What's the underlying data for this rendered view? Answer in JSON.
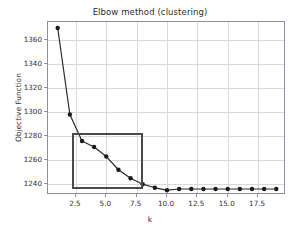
{
  "chart_data": {
    "type": "line",
    "title": "Elbow method (clustering)",
    "xlabel": "k",
    "ylabel": "Objective Function",
    "x": [
      1,
      2,
      3,
      4,
      5,
      6,
      7,
      8,
      9,
      10,
      11,
      12,
      13,
      14,
      15,
      16,
      17,
      18,
      19
    ],
    "values": [
      1370,
      1298,
      1276,
      1271,
      1263,
      1252,
      1245,
      1240,
      1237,
      1235,
      1236,
      1236,
      1236,
      1236,
      1236,
      1236,
      1236,
      1236,
      1236
    ],
    "series": [
      {
        "name": "objective",
        "values": [
          1370,
          1298,
          1276,
          1271,
          1263,
          1252,
          1245,
          1240,
          1237,
          1235,
          1236,
          1236,
          1236,
          1236,
          1236,
          1236,
          1236,
          1236,
          1236
        ]
      }
    ],
    "xlim": [
      0.2,
      19.8
    ],
    "ylim": [
      1231,
      1375
    ],
    "xticks": [
      2.5,
      5.0,
      7.5,
      10.0,
      12.5,
      15.0,
      17.5
    ],
    "xtick_labels": [
      "2.5",
      "5.0",
      "7.5",
      "10.0",
      "12.5",
      "15.0",
      "17.5"
    ],
    "yticks": [
      1240,
      1260,
      1280,
      1300,
      1320,
      1340,
      1360
    ],
    "ytick_labels": [
      "1240",
      "1260",
      "1280",
      "1300",
      "1320",
      "1340",
      "1360"
    ],
    "grid": true,
    "legend": null,
    "line_color": "#2b2b2b",
    "marker_color": "#1a1a1a",
    "marker": "circle",
    "annotations": [
      {
        "name": "elbow-highlight-rectangle",
        "type": "rectangle",
        "x0": 2.2,
        "x1": 8.05,
        "y0": 1236.0,
        "y1": 1283.0,
        "edge_color": "#4a4a4a",
        "fill": "none"
      }
    ]
  }
}
